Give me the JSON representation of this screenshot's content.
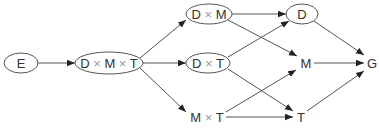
{
  "diagram": {
    "type": "directed-graph",
    "nodes": [
      {
        "id": "E",
        "parts": [
          "E"
        ],
        "shape": "ellipse",
        "cx": 21,
        "cy": 63,
        "rx": 17,
        "ry": 10
      },
      {
        "id": "DMT",
        "parts": [
          "D",
          "M",
          "T"
        ],
        "shape": "ellipse",
        "cx": 109,
        "cy": 63,
        "rx": 34,
        "ry": 11
      },
      {
        "id": "DM",
        "parts": [
          "D",
          "M"
        ],
        "shape": "ellipse",
        "cx": 209,
        "cy": 14,
        "rx": 23,
        "ry": 10
      },
      {
        "id": "DT",
        "parts": [
          "D",
          "T"
        ],
        "shape": "ellipse",
        "cx": 208,
        "cy": 63,
        "rx": 22,
        "ry": 10
      },
      {
        "id": "MT",
        "parts": [
          "M",
          "T"
        ],
        "shape": "none",
        "cx": 207,
        "cy": 117
      },
      {
        "id": "D",
        "parts": [
          "D"
        ],
        "shape": "ellipse",
        "cx": 302,
        "cy": 14,
        "rx": 16,
        "ry": 10
      },
      {
        "id": "M",
        "parts": [
          "M"
        ],
        "shape": "none",
        "cx": 306,
        "cy": 63
      },
      {
        "id": "T",
        "parts": [
          "T"
        ],
        "shape": "none",
        "cx": 301,
        "cy": 117
      },
      {
        "id": "G",
        "parts": [
          "G"
        ],
        "shape": "none",
        "cx": 372,
        "cy": 63
      }
    ],
    "labels": {
      "E": "E",
      "DMT": "D × M × T",
      "DM": "D × M",
      "DT": "D × T",
      "MT": "M × T",
      "D": "D",
      "M": "M",
      "T": "T",
      "G": "G"
    },
    "edges": [
      {
        "from": "E",
        "to": "DMT",
        "x1": 38,
        "y1": 63,
        "x2": 75,
        "y2": 63
      },
      {
        "from": "DMT",
        "to": "DM",
        "x1": 140,
        "y1": 58,
        "x2": 186,
        "y2": 20
      },
      {
        "from": "DMT",
        "to": "DT",
        "x1": 143,
        "y1": 63,
        "x2": 186,
        "y2": 63
      },
      {
        "from": "DMT",
        "to": "MT",
        "x1": 140,
        "y1": 68,
        "x2": 186,
        "y2": 112
      },
      {
        "from": "DM",
        "to": "D",
        "x1": 232,
        "y1": 14,
        "x2": 286,
        "y2": 14
      },
      {
        "from": "DM",
        "to": "M",
        "x1": 228,
        "y1": 20,
        "x2": 297,
        "y2": 56
      },
      {
        "from": "DT",
        "to": "D",
        "x1": 228,
        "y1": 57,
        "x2": 289,
        "y2": 21
      },
      {
        "from": "DT",
        "to": "T",
        "x1": 228,
        "y1": 69,
        "x2": 293,
        "y2": 111
      },
      {
        "from": "MT",
        "to": "M",
        "x1": 226,
        "y1": 112,
        "x2": 296,
        "y2": 70
      },
      {
        "from": "MT",
        "to": "T",
        "x1": 226,
        "y1": 117,
        "x2": 293,
        "y2": 117
      },
      {
        "from": "D",
        "to": "G",
        "x1": 314,
        "y1": 21,
        "x2": 364,
        "y2": 55
      },
      {
        "from": "M",
        "to": "G",
        "x1": 314,
        "y1": 63,
        "x2": 364,
        "y2": 63
      },
      {
        "from": "T",
        "to": "G",
        "x1": 307,
        "y1": 111,
        "x2": 364,
        "y2": 71
      }
    ],
    "colors": {
      "stroke": "#555555",
      "text": "#333333",
      "times_symbol": "#999999",
      "background": "#ffffff"
    }
  }
}
